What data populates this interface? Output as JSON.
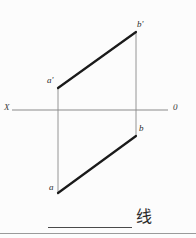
{
  "page": {
    "background_color": "#fcfcfc",
    "width": 196,
    "height": 238
  },
  "diagram": {
    "colors": {
      "projection_line": "#1a1a1a",
      "axis": "#8a8a8a",
      "connector": "#8a8a8a",
      "label": "#2b2b2b",
      "rule": "#9a9a9a"
    },
    "axis": {
      "name": "OX-axis",
      "left_label": "X",
      "right_label": "0",
      "y": 110,
      "x_start": 12,
      "x_end": 168
    },
    "points": [
      {
        "id": "a_prime",
        "label": "a'",
        "x": 58,
        "y": 88,
        "view": "front"
      },
      {
        "id": "b_prime",
        "label": "b'",
        "x": 136,
        "y": 32,
        "view": "front"
      },
      {
        "id": "a",
        "label": "a",
        "x": 58,
        "y": 193,
        "view": "top"
      },
      {
        "id": "b",
        "label": "b",
        "x": 136,
        "y": 136,
        "view": "top"
      }
    ],
    "segments": [
      {
        "id": "front-projection",
        "from": "a_prime",
        "to": "b_prime",
        "style": "thick-solid",
        "width": 2.2
      },
      {
        "id": "top-projection",
        "from": "a",
        "to": "b",
        "style": "thick-solid",
        "width": 2.2
      },
      {
        "id": "connector-a",
        "from": "a_prime",
        "to": "a",
        "style": "thin-solid",
        "width": 0.9
      },
      {
        "id": "connector-b",
        "from": "b_prime",
        "to": "b",
        "style": "thin-solid",
        "width": 0.9
      }
    ]
  },
  "answer": {
    "blank_line": "",
    "text": "线"
  }
}
